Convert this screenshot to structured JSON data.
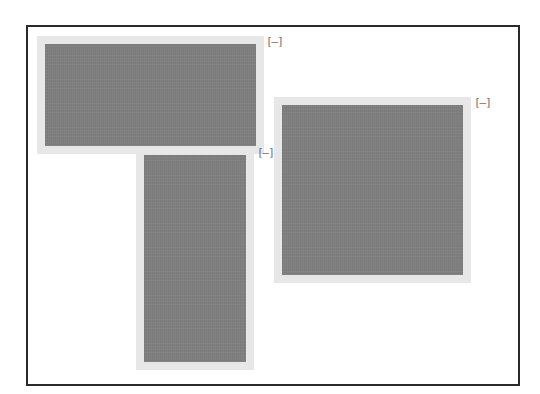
{
  "canvas": {
    "frame_color": "#2a2a2a",
    "background": "#ffffff"
  },
  "colors": {
    "panel_fill": "#7f7f7f",
    "panel_halo": "#e7e7e7",
    "collapse_glyph": "#6f6f6f"
  },
  "panels": [
    {
      "id": "panel-top-left",
      "collapse_label": "[–]"
    },
    {
      "id": "panel-tall",
      "collapse_label": "[–]"
    },
    {
      "id": "panel-right",
      "collapse_label": "[–]"
    }
  ]
}
